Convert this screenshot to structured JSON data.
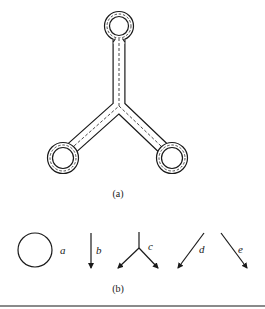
{
  "figure": {
    "part_a": {
      "caption": "(a)",
      "description": "Y-shaped tube with three ring ends, outlined by double solid walls and a dashed centerline",
      "rings": [
        {
          "name": "top",
          "cx": 119,
          "cy": 26
        },
        {
          "name": "left",
          "cx": 63,
          "cy": 158
        },
        {
          "name": "right",
          "cx": 172,
          "cy": 158
        }
      ],
      "junction": {
        "x": 119,
        "y": 106
      }
    },
    "part_b": {
      "caption": "(b)",
      "elements": [
        {
          "label": "a",
          "shape": "circle"
        },
        {
          "label": "b",
          "shape": "down-arrow"
        },
        {
          "label": "c",
          "shape": "y-branch-arrows"
        },
        {
          "label": "d",
          "shape": "down-left-arrow"
        },
        {
          "label": "e",
          "shape": "down-right-arrow"
        }
      ]
    },
    "colors": {
      "stroke": "#1a1a1a",
      "background": "#ffffff",
      "rule": "#8a8a8a"
    }
  }
}
